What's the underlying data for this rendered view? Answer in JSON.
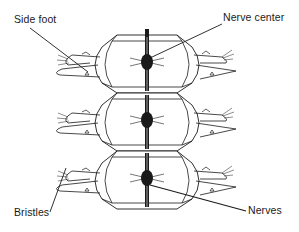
{
  "diagram": {
    "segments_count": 3,
    "colors": {
      "ink": "#1a1a1a",
      "background": "#ffffff"
    },
    "labels": {
      "side_foot": "Side foot",
      "nerve_center": "Nerve center",
      "bristles": "Bristles",
      "nerves": "Nerves"
    }
  }
}
